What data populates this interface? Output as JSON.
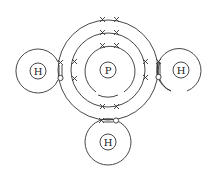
{
  "diagram": {
    "title": "",
    "type": "electron dot-cross diagram",
    "molecule": "PH3",
    "atoms": [
      {
        "id": "P",
        "label": "P",
        "role": "central"
      },
      {
        "id": "H1",
        "label": "H",
        "position": "left"
      },
      {
        "id": "H2",
        "label": "H",
        "position": "right"
      },
      {
        "id": "H3",
        "label": "H",
        "position": "bottom"
      }
    ],
    "legend": {
      "cross": "electron of P",
      "dot": "electron of H"
    },
    "colors": {
      "stroke": "#333333",
      "background": "#ffffff"
    }
  }
}
